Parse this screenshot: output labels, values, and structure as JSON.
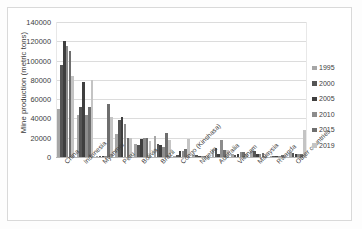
{
  "chart_data": {
    "type": "bar",
    "title": "",
    "subtitle": "",
    "xlabel": "",
    "ylabel": "Mine production (metric tons)",
    "ylim": [
      0,
      140000
    ],
    "ytick_values": [
      0,
      20000,
      40000,
      60000,
      80000,
      100000,
      120000,
      140000
    ],
    "ytick_labels": [
      "0",
      "20000",
      "40000",
      "60000",
      "80000",
      "100000",
      "120000",
      "140000"
    ],
    "grid": true,
    "legend_position": "right",
    "categories": [
      "China",
      "Indonesia",
      "Myanmar",
      "Peru",
      "Bolivia",
      "Brazil",
      "Congo (Kinshasa)",
      "Nigeria",
      "Australia",
      "Vietnam",
      "Malaysia",
      "Rwanda",
      "Other countries"
    ],
    "series": [
      {
        "name": "1995",
        "color": "#a6a6a6",
        "values": [
          50000,
          44000,
          500,
          24000,
          14000,
          22000,
          1000,
          2400,
          8000,
          3600,
          6400,
          400,
          5000
        ]
      },
      {
        "name": "2000",
        "color": "#555555",
        "values": [
          95000,
          52000,
          1200,
          38000,
          12500,
          14000,
          2000,
          2500,
          9500,
          2000,
          6300,
          300,
          4000
        ]
      },
      {
        "name": "2005",
        "color": "#3f3f3f",
        "values": [
          120000,
          78000,
          700,
          42000,
          18600,
          12000,
          6000,
          1500,
          2800,
          3600,
          2900,
          500,
          3500
        ]
      },
      {
        "name": "2010",
        "color": "#8c8c8c",
        "values": [
          115000,
          44000,
          1200,
          34000,
          20200,
          10500,
          6600,
          600,
          18000,
          5400,
          2700,
          800,
          3000
        ]
      },
      {
        "name": "2015",
        "color": "#6e6e6e",
        "values": [
          110000,
          52000,
          55000,
          19500,
          20100,
          25000,
          8000,
          700,
          7000,
          5000,
          4000,
          2100,
          3500
        ]
      },
      {
        "name": "2019",
        "color": "#c4c4c4",
        "values": [
          84000,
          80000,
          42000,
          19900,
          17000,
          17500,
          19000,
          1000,
          7000,
          3500,
          3600,
          1800,
          28000
        ]
      }
    ]
  },
  "legend": {
    "entries": [
      "1995",
      "2000",
      "2005",
      "2010",
      "2015",
      "2019"
    ]
  },
  "colors": {
    "background": "#ffffff",
    "grid": "#dcdcdc",
    "axis": "#b4b4b4",
    "text": "#3d3d3d",
    "frame": "#d9d9d9"
  }
}
